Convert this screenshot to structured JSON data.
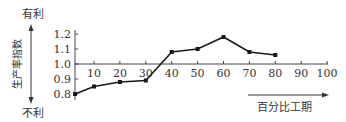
{
  "chart_data": {
    "type": "line",
    "title": "",
    "xlabel": "百分比工期",
    "ylabel": "生产率指数",
    "y_top_annotation": "有利",
    "y_bottom_annotation": "不利",
    "x": [
      0,
      10,
      20,
      30,
      40,
      50,
      60,
      70,
      80
    ],
    "values": [
      0.8,
      0.85,
      0.88,
      0.89,
      1.08,
      1.1,
      1.18,
      1.08,
      1.06
    ],
    "x_ticks": [
      10,
      20,
      30,
      40,
      50,
      60,
      70,
      80,
      90,
      100
    ],
    "y_ticks": [
      0.8,
      0.9,
      1.0,
      1.1,
      1.2
    ],
    "y_tick_labels": [
      "0.8",
      "0.9",
      "1.0",
      "1.1",
      "1.2"
    ],
    "x_tick_labels": [
      "10",
      "20",
      "30",
      "40",
      "50",
      "60",
      "70",
      "80",
      "90",
      "100"
    ],
    "xlim": [
      0,
      100
    ],
    "ylim": [
      0.8,
      1.2
    ],
    "x_axis_crosses_at_y": 1.0,
    "grid": false,
    "legend": null,
    "line_color": "#1a1a1a",
    "marker": "square"
  }
}
